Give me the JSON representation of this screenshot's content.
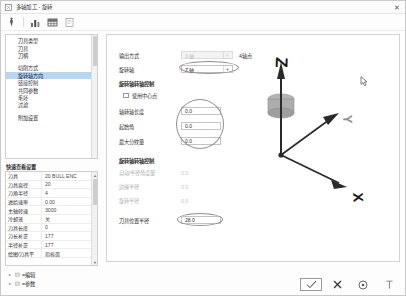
{
  "window": {
    "title": "多轴加工 - 旋转",
    "icon": "app-icon",
    "close_label": "✕"
  },
  "toolbar": {
    "buttons": [
      {
        "name": "tool-icon",
        "label": "刀具"
      },
      {
        "name": "chart-icon",
        "label": "图表"
      },
      {
        "name": "table-icon",
        "label": "表格"
      },
      {
        "name": "page-icon",
        "label": "页面"
      }
    ]
  },
  "sidebar": {
    "tree_items": [
      {
        "label": "刀具类型",
        "selected": false,
        "gap_after": false
      },
      {
        "label": "刀具",
        "selected": false,
        "gap_after": false
      },
      {
        "label": "刀柄",
        "selected": false,
        "gap_after": true
      },
      {
        "label": "切削方式",
        "selected": false,
        "gap_after": false
      },
      {
        "label": "旋转轴方向",
        "selected": true,
        "gap_after": false
      },
      {
        "label": "链接控制",
        "selected": false,
        "gap_after": false
      },
      {
        "label": "共同参数",
        "selected": false,
        "gap_after": false
      },
      {
        "label": "毛坯",
        "selected": false,
        "gap_after": false
      },
      {
        "label": "过滤",
        "selected": false,
        "gap_after": true
      },
      {
        "label": "附加设置",
        "selected": false,
        "gap_after": false
      }
    ],
    "property_title": "快速查看设置",
    "properties": [
      {
        "key": "刀具",
        "value": "20 BULL ENC"
      },
      {
        "key": "刀具直径",
        "value": "20"
      },
      {
        "key": "刀角半径",
        "value": "4"
      },
      {
        "key": "进给速率",
        "value": "0.00"
      },
      {
        "key": "主轴转速",
        "value": "3000"
      },
      {
        "key": "冷却液",
        "value": "关"
      },
      {
        "key": "刀具长度",
        "value": "0"
      },
      {
        "key": "刀长补正",
        "value": "177"
      },
      {
        "key": "半径补正",
        "value": "177"
      },
      {
        "key": "绘图/刀具平",
        "value": "指板面"
      }
    ],
    "bottom_items": [
      {
        "label": "=编辑",
        "arrow": "▸"
      },
      {
        "label": "=参数",
        "arrow": "▸"
      }
    ]
  },
  "form": {
    "output_mode": {
      "label": "输出方式",
      "value": "3 轴",
      "suffix": "4轴点",
      "disabled": true
    },
    "rotate_axis": {
      "label": "旋转轴",
      "value": "Z 轴",
      "disabled": false
    },
    "section_rotary": "旋转轴转轴控制",
    "use_center": {
      "label": "使用中心点",
      "checked": false
    },
    "fields_enabled": [
      {
        "label": "轴转轴长度",
        "value": "0.0"
      },
      {
        "label": "起始角",
        "value": "0.0"
      },
      {
        "label": "最大分纹量",
        "value": "0.0"
      }
    ],
    "section_linear": "旋转轴转轴控制",
    "fields_disabled": [
      {
        "label": "自动/半径角度量",
        "value": "0.0"
      },
      {
        "label": "边缘半径",
        "value": "0.0"
      },
      {
        "label": "旋转半径",
        "value": "0.0"
      }
    ],
    "tool_length": {
      "label": "刀具位置半径",
      "value": "28.0"
    }
  },
  "viewport": {
    "axis_z": "Z",
    "axis_x": "X",
    "axis_y": "Y"
  },
  "actions": [
    {
      "name": "ok-button",
      "icon": "check",
      "primary": true
    },
    {
      "name": "cancel-button",
      "icon": "cross",
      "primary": false
    },
    {
      "name": "help-button",
      "icon": "question-circle",
      "primary": false
    },
    {
      "name": "pin-button",
      "icon": "pin",
      "primary": false
    }
  ],
  "colors": {
    "selection": "#b8d6f0",
    "axis": "#2a2a2a",
    "cylinder": "#a9a9a9"
  }
}
